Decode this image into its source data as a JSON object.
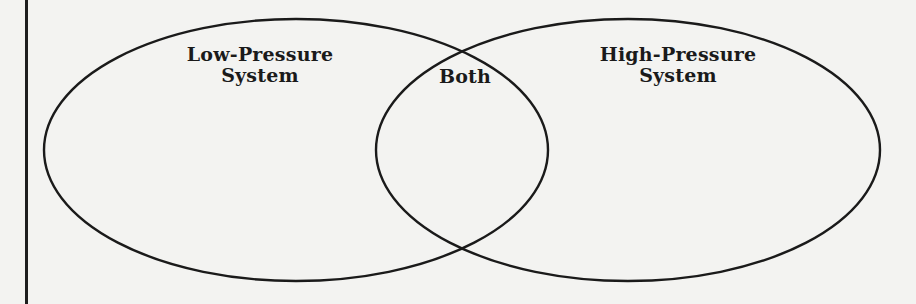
{
  "diagram": {
    "type": "venn",
    "sets": [
      {
        "id": "left",
        "label_line1": "Low-Pressure",
        "label_line2": "System"
      },
      {
        "id": "right",
        "label_line1": "High-Pressure",
        "label_line2": "System"
      }
    ],
    "intersection": {
      "label": "Both"
    },
    "colors": {
      "stroke": "#1a1a1a",
      "background": "#f3f3f1"
    }
  }
}
